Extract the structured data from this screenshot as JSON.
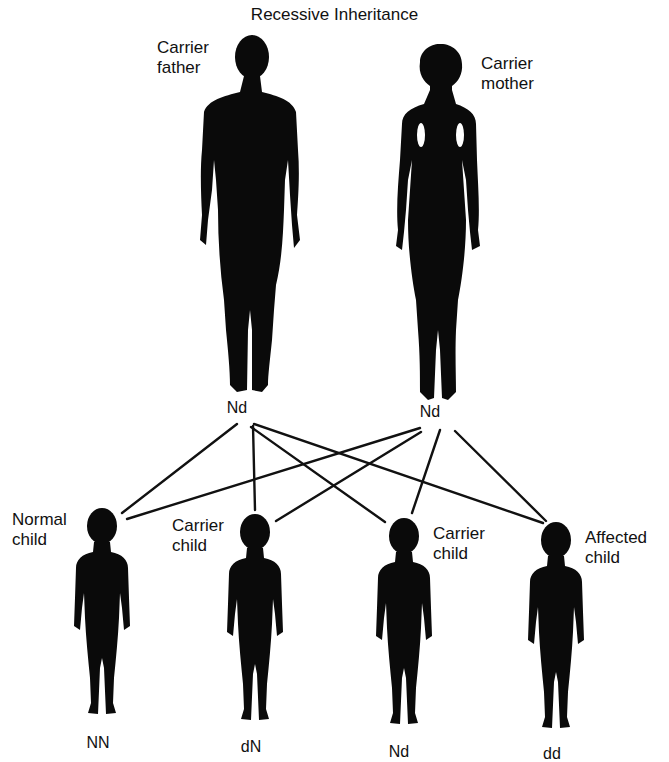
{
  "title": "Recessive Inheritance",
  "colors": {
    "silhouette": "#0a0a0a",
    "line": "#111111",
    "background": "#ffffff",
    "text": "#111111"
  },
  "parents": [
    {
      "id": "father",
      "label": "Carrier\nfather",
      "genotype": "Nd"
    },
    {
      "id": "mother",
      "label": "Carrier\nmother",
      "genotype": "Nd"
    }
  ],
  "children": [
    {
      "id": "child1",
      "label": "Normal\nchild",
      "genotype": "NN"
    },
    {
      "id": "child2",
      "label": "Carrier\nchild",
      "genotype": "dN"
    },
    {
      "id": "child3",
      "label": "Carrier\nchild",
      "genotype": "Nd"
    },
    {
      "id": "child4",
      "label": "Affected\nchild",
      "genotype": "dd"
    }
  ]
}
